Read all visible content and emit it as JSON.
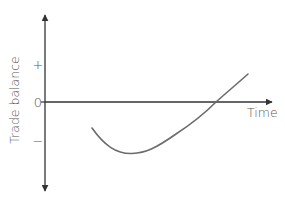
{
  "diagram": {
    "type": "j-curve",
    "y_axis": {
      "title": "Trade balance",
      "ticks": [
        {
          "label": "+",
          "position": "positive"
        },
        {
          "label": "0",
          "position": "zero"
        },
        {
          "label": "−",
          "position": "negative"
        }
      ]
    },
    "x_axis": {
      "title": "Time"
    },
    "curve": {
      "description": "Trade balance starts negative, falls further to a minimum, then rises and crosses zero into positive territory (J-curve)",
      "color": "#6b6b6b"
    },
    "colors": {
      "axes": "#333333",
      "labels": "#555555",
      "curve": "#6b6b6b",
      "background": "#ffffff"
    }
  }
}
